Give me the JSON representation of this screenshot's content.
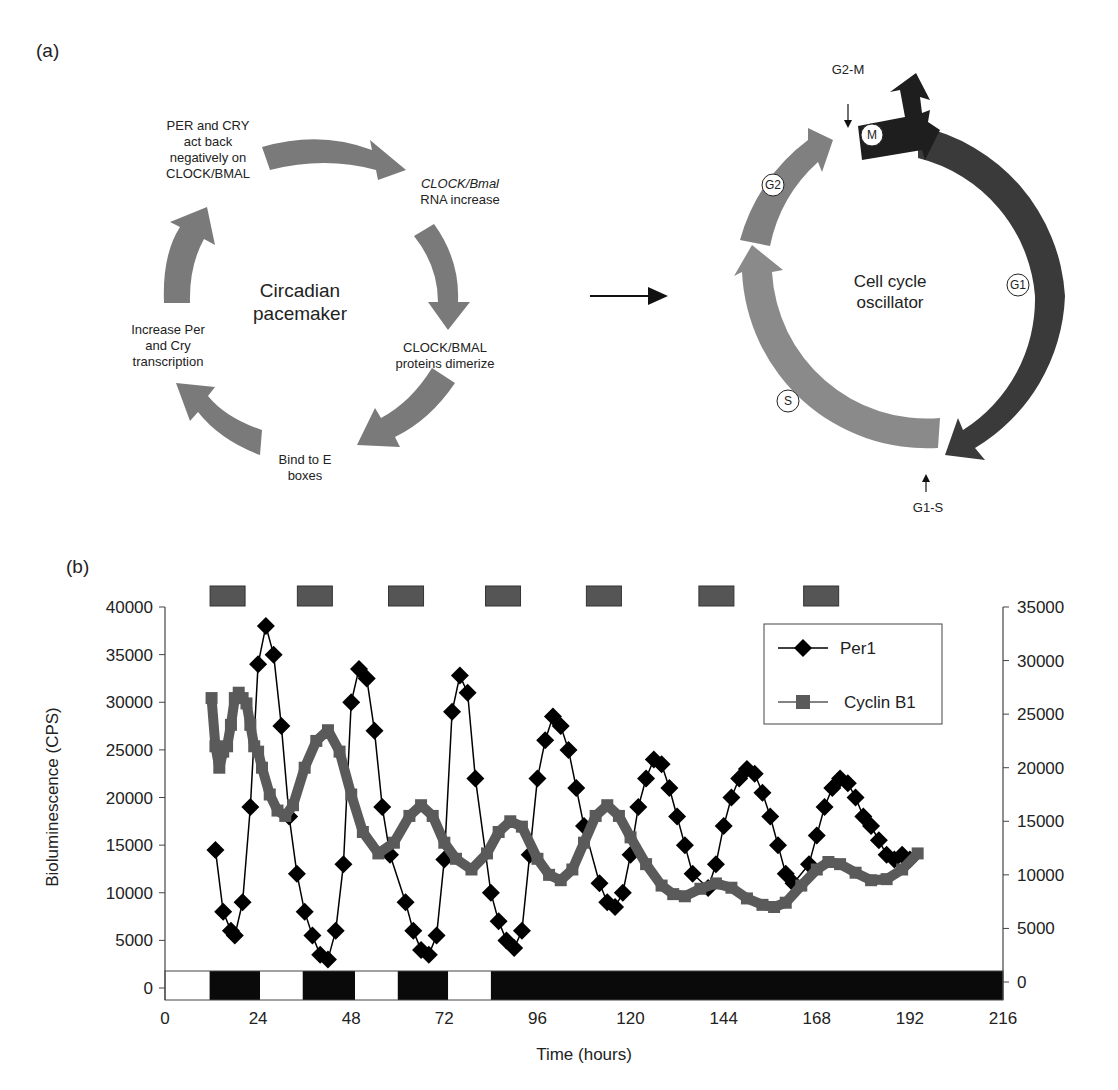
{
  "panel_a": {
    "label": "(a)",
    "circadian": {
      "center_line1": "Circadian",
      "center_line2": "pacemaker",
      "steps": [
        {
          "lines": [
            "CLOCK/Bmal",
            "RNA increase"
          ],
          "italic_first": true
        },
        {
          "lines": [
            "CLOCK/BMAL",
            "proteins dimerize"
          ]
        },
        {
          "lines": [
            "Bind to E",
            "boxes"
          ]
        },
        {
          "lines": [
            "Increase Per",
            "and Cry",
            "transcription"
          ]
        },
        {
          "lines": [
            "PER and CRY",
            "act back",
            "negatively on",
            "CLOCK/BMAL"
          ]
        }
      ],
      "arrow_color": "#7a7a7a"
    },
    "cell_cycle": {
      "center_line1": "Cell cycle",
      "center_line2": "oscillator",
      "phases": [
        {
          "name": "M",
          "color": "#1e1e1e"
        },
        {
          "name": "G1",
          "color": "#3a3a3a"
        },
        {
          "name": "S",
          "color": "#8a8a8a"
        },
        {
          "name": "G2",
          "color": "#808080"
        }
      ],
      "checkpoints": [
        "G2-M",
        "G1-S"
      ]
    }
  },
  "panel_b": {
    "label": "(b)"
  },
  "chart_data": {
    "type": "line",
    "title": "",
    "xlabel": "Time (hours)",
    "ylabel": "Bioluminescence (CPS)",
    "xlim": [
      0,
      216
    ],
    "ylim_left": [
      0,
      40000
    ],
    "ylim_right": [
      0,
      35000
    ],
    "x_ticks": [
      "0",
      "24",
      "48",
      "72",
      "96",
      "120",
      "144",
      "168",
      "192",
      "216"
    ],
    "y_ticks_left": [
      "0",
      "5000",
      "10000",
      "15000",
      "20000",
      "25000",
      "30000",
      "35000",
      "40000"
    ],
    "y_ticks_right": [
      "0",
      "5000",
      "10000",
      "15000",
      "20000",
      "25000",
      "30000",
      "35000"
    ],
    "grid": false,
    "legend_position": "upper right",
    "legend": [
      "Per1",
      "Cyclin B1"
    ],
    "series": [
      {
        "name": "Per1",
        "axis": "left",
        "marker": "diamond",
        "color": "#000000",
        "x": [
          13,
          15,
          17,
          18,
          20,
          22,
          24,
          26,
          28,
          30,
          32,
          34,
          36,
          38,
          40,
          42,
          44,
          46,
          48,
          50,
          52,
          54,
          56,
          58,
          62,
          64,
          66,
          68,
          70,
          72,
          74,
          76,
          78,
          80,
          84,
          86,
          88,
          90,
          92,
          94,
          96,
          98,
          100,
          102,
          104,
          106,
          108,
          112,
          114,
          116,
          118,
          120,
          122,
          124,
          126,
          128,
          130,
          132,
          134,
          136,
          140,
          142,
          144,
          146,
          148,
          150,
          152,
          154,
          156,
          158,
          160,
          162,
          166,
          168,
          170,
          172,
          174,
          176,
          178,
          180,
          182,
          184,
          186,
          188,
          190,
          192
        ],
        "y": [
          14500,
          8000,
          6000,
          5500,
          9000,
          19000,
          34000,
          38000,
          35000,
          27500,
          18000,
          12000,
          8000,
          5500,
          3500,
          3000,
          6000,
          13000,
          30000,
          33500,
          32500,
          27000,
          19000,
          14000,
          9000,
          6000,
          4000,
          3500,
          5500,
          13500,
          29000,
          32800,
          31000,
          22000,
          10000,
          7000,
          5000,
          4200,
          6000,
          14000,
          22000,
          26000,
          28500,
          27500,
          25000,
          21000,
          17000,
          11000,
          9000,
          8500,
          10000,
          14000,
          19000,
          22000,
          24000,
          23500,
          21000,
          18000,
          15000,
          12000,
          10500,
          13000,
          17000,
          20000,
          22000,
          23000,
          22500,
          20500,
          18000,
          15000,
          12000,
          11000,
          13000,
          16000,
          19000,
          21000,
          22000,
          21500,
          20000,
          18000,
          17000,
          15500,
          14000,
          13500,
          14000,
          13500
        ]
      },
      {
        "name": "Cyclin B1",
        "axis": "right",
        "marker": "square",
        "color": "#5a5a5a",
        "x": [
          12,
          13,
          14,
          15,
          16,
          17,
          18,
          19,
          20,
          21,
          22,
          23,
          24,
          25,
          27,
          29,
          31,
          33,
          36,
          39,
          42,
          45,
          48,
          51,
          55,
          59,
          63,
          66,
          69,
          72,
          75,
          79,
          83,
          86,
          89,
          92,
          96,
          99,
          102,
          105,
          108,
          111,
          114,
          117,
          120,
          124,
          128,
          131,
          134,
          138,
          142,
          146,
          150,
          154,
          157,
          160,
          164,
          168,
          171,
          174,
          178,
          182,
          186,
          190,
          194
        ],
        "y": [
          26500,
          22000,
          20000,
          21500,
          22000,
          24000,
          26500,
          27000,
          26500,
          26000,
          24000,
          22000,
          21500,
          20000,
          17500,
          16000,
          15500,
          16500,
          20000,
          22500,
          23500,
          21500,
          17500,
          14000,
          12000,
          13000,
          15500,
          16500,
          15500,
          13000,
          11500,
          10500,
          12000,
          14000,
          15000,
          14500,
          11500,
          10000,
          9500,
          10500,
          13000,
          15500,
          16500,
          15500,
          13500,
          11000,
          9000,
          8200,
          8000,
          8700,
          9200,
          8800,
          7800,
          7200,
          7000,
          7400,
          9000,
          10500,
          11200,
          11000,
          10200,
          9500,
          9600,
          10500,
          12000
        ]
      }
    ],
    "light_dark_bar": {
      "segments": [
        {
          "start": 0,
          "end": 11.5,
          "state": "light"
        },
        {
          "start": 11.5,
          "end": 24.5,
          "state": "dark"
        },
        {
          "start": 24.5,
          "end": 35.5,
          "state": "light"
        },
        {
          "start": 35.5,
          "end": 49,
          "state": "dark"
        },
        {
          "start": 49,
          "end": 60,
          "state": "light"
        },
        {
          "start": 60,
          "end": 73,
          "state": "dark"
        },
        {
          "start": 73,
          "end": 84,
          "state": "light"
        },
        {
          "start": 84,
          "end": 216,
          "state": "dark"
        }
      ]
    },
    "top_markers": {
      "color": "#555555",
      "centers_hours": [
        16,
        38.5,
        62,
        87,
        113,
        142,
        169
      ]
    }
  }
}
